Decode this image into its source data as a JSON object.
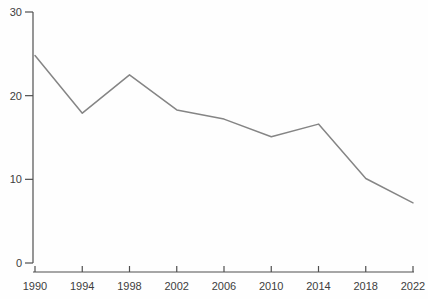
{
  "chart_data": {
    "type": "line",
    "title": "",
    "xlabel": "",
    "ylabel": "",
    "categories": [
      1990,
      1994,
      1998,
      2002,
      2006,
      2010,
      2014,
      2018,
      2022
    ],
    "x_tick_labels": [
      "1990",
      "1994",
      "1998",
      "2002",
      "2006",
      "2010",
      "2014",
      "2018",
      "2022"
    ],
    "series": [
      {
        "name": "value",
        "x": [
          1990,
          1994,
          1998,
          2002,
          2006,
          2010,
          2014,
          2018,
          2022
        ],
        "values": [
          24.8,
          17.9,
          22.5,
          18.3,
          17.2,
          15.1,
          16.6,
          10.1,
          7.2
        ]
      }
    ],
    "xlim": [
      1990,
      2022
    ],
    "ylim": [
      0,
      30
    ],
    "y_ticks": [
      0,
      10,
      20,
      30
    ],
    "y_tick_labels": [
      "0",
      "10",
      "20",
      "30"
    ],
    "grid": "off",
    "legend": "none",
    "line_color": "#858585",
    "axis_color": "#4f4f4f",
    "tick_text_color": "#3d3d3d",
    "background_color": "#fefefe"
  }
}
